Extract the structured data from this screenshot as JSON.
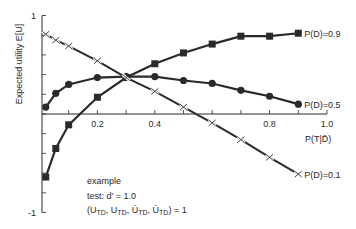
{
  "chart_data": {
    "type": "line",
    "title": "",
    "xlabel": "P(T|D̄)",
    "ylabel": "Expected utility E[U]",
    "xlim": [
      0,
      1.0
    ],
    "ylim": [
      -1,
      1
    ],
    "x_ticks": [
      0.2,
      0.4,
      0.8,
      1.0
    ],
    "x_tick_labels": [
      "0.2",
      "0.4",
      "0.8",
      "1.0"
    ],
    "x_minor_step": 0.1,
    "y_ticks": [
      1,
      -1
    ],
    "y_tick_labels": [
      "1",
      "-1"
    ],
    "y_minor_step": 0.2,
    "grid": false,
    "x": [
      0.02,
      0.055,
      0.1,
      0.2,
      0.3,
      0.4,
      0.5,
      0.6,
      0.7,
      0.8,
      0.9
    ],
    "series": [
      {
        "name": "P(D)=0.9",
        "marker": "square",
        "values": [
          -0.64,
          -0.35,
          -0.11,
          0.17,
          0.37,
          0.51,
          0.62,
          0.71,
          0.79,
          0.79,
          0.82
        ]
      },
      {
        "name": "P(D)=0.5",
        "marker": "circle",
        "values": [
          0.07,
          0.21,
          0.3,
          0.37,
          0.38,
          0.38,
          0.34,
          0.31,
          0.24,
          0.18,
          0.1
        ]
      },
      {
        "name": "P(D)=0.1",
        "marker": "cross",
        "values": [
          0.81,
          0.75,
          0.69,
          0.54,
          0.37,
          0.23,
          0.07,
          -0.09,
          -0.26,
          -0.44,
          -0.61
        ]
      }
    ],
    "legend_position": "inline-right",
    "annotations": [
      "example",
      "test: d' = 1.0",
      "(U_TD, U_TD̄, U_T̄D, U_T̄D̄) = 1"
    ]
  },
  "annotation": {
    "line1": "example",
    "line2": "test: d' = 1.0",
    "formula": {
      "open": "(",
      "terms": [
        {
          "u": "U",
          "sub": "TD",
          "sep": ", "
        },
        {
          "u": "U",
          "sub": "TD",
          "sep": ", "
        },
        {
          "u": "Ū",
          "sub": "TD",
          "sep": ", "
        },
        {
          "u": "Ū",
          "sub": "TD",
          "sep": ""
        }
      ],
      "close": ") = 1"
    }
  },
  "colors": {
    "ink": "#2a2a2a",
    "background": "#ffffff"
  }
}
